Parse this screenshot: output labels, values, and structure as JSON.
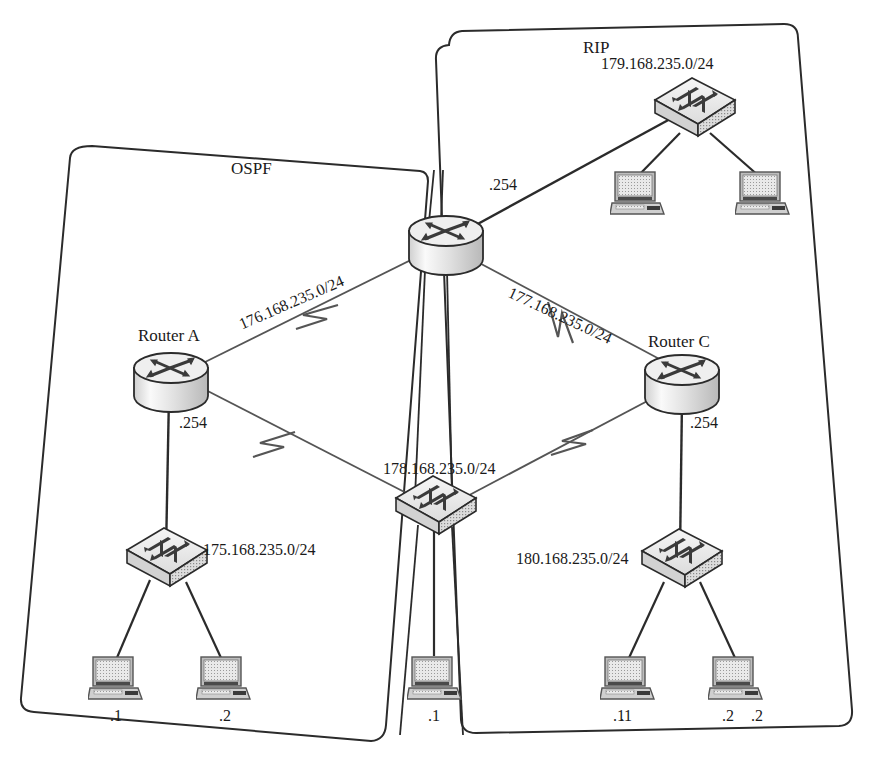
{
  "diagram": {
    "type": "network-topology",
    "stroke_color": "#2b2b2b",
    "fill_light": "#e6e6e6",
    "fill_mid": "#c9c9c9"
  },
  "zones": [
    {
      "id": "ospf",
      "label": "OSPF"
    },
    {
      "id": "rip",
      "label": "RIP"
    }
  ],
  "routers": [
    {
      "id": "router-a",
      "label": "Router A",
      "interface_label": ".254"
    },
    {
      "id": "router-b",
      "label": "",
      "interface_label": ".254"
    },
    {
      "id": "router-c",
      "label": "Router C",
      "interface_label": ".254"
    }
  ],
  "networks": [
    {
      "id": "net-176",
      "label": "176.168.235.0/24",
      "kind": "wan-link"
    },
    {
      "id": "net-177",
      "label": "177.168.235.0/24",
      "kind": "wan-link"
    },
    {
      "id": "net-178",
      "label": "178.168.235.0/24",
      "kind": "lan"
    },
    {
      "id": "net-179",
      "label": "179.168.235.0/24",
      "kind": "lan"
    },
    {
      "id": "net-175",
      "label": "175.168.235.0/24",
      "kind": "lan"
    },
    {
      "id": "net-180",
      "label": "180.168.235.0/24",
      "kind": "lan"
    }
  ],
  "switches": [
    {
      "id": "switch-175",
      "network": "175.168.235.0/24"
    },
    {
      "id": "switch-178",
      "network": "178.168.235.0/24"
    },
    {
      "id": "switch-179",
      "network": "179.168.235.0/24"
    },
    {
      "id": "switch-180",
      "network": "180.168.235.0/24"
    }
  ],
  "hosts": [
    {
      "id": "host-175-1",
      "label": ".1",
      "network": "175.168.235.0/24"
    },
    {
      "id": "host-175-2",
      "label": ".2",
      "network": "175.168.235.0/24"
    },
    {
      "id": "host-178-1",
      "label": ".1",
      "network": "178.168.235.0/24"
    },
    {
      "id": "host-179-1",
      "label": ".1",
      "network": "179.168.235.0/24"
    },
    {
      "id": "host-179-2",
      "label": ".2",
      "network": "179.168.235.0/24"
    },
    {
      "id": "host-180-1",
      "label": ".1",
      "network": "180.168.235.0/24"
    },
    {
      "id": "host-180-2",
      "label": ".2",
      "network": "180.168.235.0/24"
    }
  ],
  "interface_labels": {
    "router_b_to_179": ".254",
    "router_a_to_175": ".254",
    "router_c_to_180": ".254"
  }
}
